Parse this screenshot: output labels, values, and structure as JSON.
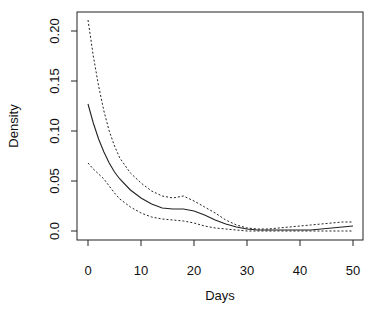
{
  "chart_data": {
    "type": "line",
    "title": "",
    "xlabel": "Days",
    "ylabel": "Density",
    "xlim": [
      0,
      50
    ],
    "ylim": [
      0,
      0.21
    ],
    "x_ticks": [
      0,
      10,
      20,
      30,
      40,
      50
    ],
    "x_tick_labels": [
      "0",
      "10",
      "20",
      "30",
      "40",
      "50"
    ],
    "y_ticks": [
      0.0,
      0.05,
      0.1,
      0.15,
      0.2
    ],
    "y_tick_labels": [
      "0.0",
      "0.05",
      "0.10",
      "0.15",
      "0.20"
    ],
    "grid": false,
    "legend": null,
    "x": [
      0,
      1,
      2,
      3,
      4,
      5,
      6,
      8,
      10,
      12,
      14,
      16,
      18,
      20,
      22,
      24,
      26,
      28,
      30,
      32,
      34,
      36,
      38,
      40,
      42,
      44,
      46,
      48,
      50
    ],
    "series": [
      {
        "name": "estimate",
        "style": "solid",
        "values": [
          0.127,
          0.108,
          0.092,
          0.079,
          0.068,
          0.059,
          0.052,
          0.041,
          0.033,
          0.027,
          0.023,
          0.022,
          0.022,
          0.02,
          0.016,
          0.011,
          0.007,
          0.004,
          0.002,
          0.001,
          0.001,
          0.001,
          0.001,
          0.001,
          0.001,
          0.002,
          0.003,
          0.004,
          0.005
        ]
      },
      {
        "name": "upper bound",
        "style": "dotted",
        "values": [
          0.211,
          0.175,
          0.145,
          0.12,
          0.1,
          0.085,
          0.073,
          0.058,
          0.048,
          0.04,
          0.035,
          0.033,
          0.035,
          0.03,
          0.024,
          0.018,
          0.011,
          0.006,
          0.003,
          0.002,
          0.002,
          0.003,
          0.004,
          0.005,
          0.006,
          0.007,
          0.008,
          0.009,
          0.009
        ]
      },
      {
        "name": "lower bound",
        "style": "dotted",
        "values": [
          0.068,
          0.062,
          0.057,
          0.052,
          0.045,
          0.038,
          0.032,
          0.024,
          0.018,
          0.014,
          0.012,
          0.011,
          0.01,
          0.008,
          0.005,
          0.003,
          0.002,
          0.001,
          0.0,
          0.0,
          0.0,
          0.0,
          0.0,
          0.0,
          0.0,
          0.0,
          0.0,
          0.0,
          0.0
        ]
      }
    ]
  }
}
